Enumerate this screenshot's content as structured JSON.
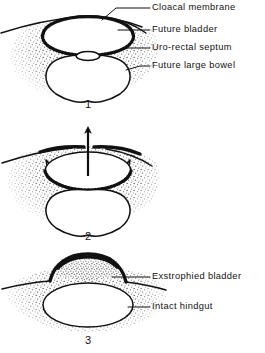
{
  "figure": {
    "style": "stippled medical line drawing",
    "ink_color": "#111111",
    "background_color": "#ffffff"
  },
  "panels": [
    {
      "number": "1",
      "labels": [
        {
          "text": "Cloacal membrane",
          "target": "cloacal-membrane"
        },
        {
          "text": "Future bladder",
          "target": "future-bladder"
        },
        {
          "text": "Uro-rectal septum",
          "target": "uro-rectal-septum"
        },
        {
          "text": "Future large bowel",
          "target": "future-large-bowel"
        }
      ],
      "arrow": null
    },
    {
      "number": "2",
      "labels": [],
      "arrow": {
        "direction": "up",
        "name": "rupture-arrow"
      }
    },
    {
      "number": "3",
      "labels": [
        {
          "text": "Exstrophied bladder",
          "target": "exstrophied-bladder"
        },
        {
          "text": "Intact hindgut",
          "target": "intact-hindgut"
        }
      ],
      "arrow": null
    }
  ]
}
